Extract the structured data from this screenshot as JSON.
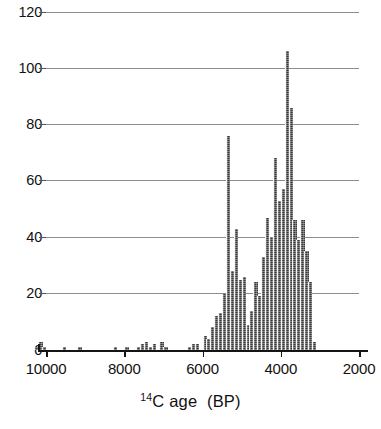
{
  "chart_data": {
    "type": "bar",
    "title": "",
    "subtitle": "",
    "xlabel_html": "<sup>14</sup>C age (BP)",
    "xlabel": "14C age (BP)",
    "ylabel": "",
    "xlim": [
      10300,
      1800
    ],
    "ylim": [
      0,
      120
    ],
    "x_inverted": true,
    "grid": "horizontal",
    "legend": "none",
    "bin_width": 100,
    "bar_color": "#3a3a3a",
    "xticks": [
      10000,
      8000,
      6000,
      4000,
      2000
    ],
    "xtick_labels": [
      "10000",
      "8000",
      "6000",
      "4000",
      "2000"
    ],
    "yticks": [
      0,
      20,
      40,
      60,
      80,
      100,
      120
    ],
    "ytick_labels": [
      "0",
      "20",
      "40",
      "60",
      "80",
      "100",
      "120"
    ],
    "x": [
      10250,
      10150,
      10050,
      9950,
      9850,
      9750,
      9650,
      9550,
      9450,
      9350,
      9250,
      9150,
      9050,
      8950,
      8850,
      8750,
      8650,
      8550,
      8450,
      8350,
      8250,
      8150,
      8050,
      7950,
      7850,
      7750,
      7650,
      7550,
      7450,
      7350,
      7250,
      7150,
      7050,
      6950,
      6850,
      6750,
      6650,
      6550,
      6450,
      6350,
      6250,
      6150,
      6050,
      5950,
      5850,
      5750,
      5650,
      5550,
      5450,
      5350,
      5250,
      5150,
      5050,
      4950,
      4850,
      4750,
      4650,
      4550,
      4450,
      4350,
      4250,
      4150,
      4050,
      3950,
      3850,
      3750,
      3650,
      3550,
      3450,
      3350,
      3250,
      3150,
      3050,
      2950,
      2850,
      2750,
      2650,
      2550,
      2450,
      2350,
      2250,
      2150,
      2050,
      1950
    ],
    "values": [
      1,
      3,
      1,
      0,
      0,
      0,
      0,
      1,
      0,
      0,
      0,
      1,
      0,
      0,
      0,
      0,
      0,
      0,
      0,
      0,
      1,
      0,
      0,
      1,
      0,
      0,
      1,
      2,
      3,
      1,
      2,
      0,
      3,
      1,
      0,
      0,
      0,
      0,
      0,
      1,
      2,
      2,
      0,
      5,
      4,
      8,
      12,
      13,
      20,
      76,
      28,
      43,
      25,
      26,
      9,
      14,
      24,
      19,
      33,
      47,
      40,
      68,
      53,
      57,
      106,
      86,
      46,
      39,
      46,
      35,
      24,
      3,
      0,
      0,
      0,
      0,
      0,
      0,
      0,
      0,
      0,
      0,
      0,
      0
    ],
    "annotations": []
  },
  "axis": {
    "x_title_main": "C age",
    "x_title_sup": "14",
    "x_title_paren": "(BP)"
  }
}
